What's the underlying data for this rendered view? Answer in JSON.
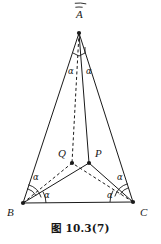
{
  "figure": {
    "caption": "图 10.3(7)",
    "colors": {
      "stroke": "#1a1a1a",
      "background": "#ffffff",
      "label": "#1a1a1a"
    },
    "vertices": [
      {
        "name": "A",
        "label": "A",
        "x": 79,
        "y": 33,
        "label_x": 76,
        "label_y": 18,
        "dot": true
      },
      {
        "name": "B",
        "label": "B",
        "x": 23,
        "y": 203,
        "label_x": 7,
        "label_y": 216,
        "dot": true
      },
      {
        "name": "C",
        "label": "C",
        "x": 133,
        "y": 202,
        "label_x": 140,
        "label_y": 216,
        "dot": true
      },
      {
        "name": "Q",
        "label": "Q",
        "x": 72,
        "y": 163,
        "label_x": 58,
        "label_y": 157,
        "dot": true
      },
      {
        "name": "P",
        "label": "P",
        "x": 89,
        "y": 163,
        "label_x": 95,
        "label_y": 157,
        "dot": true
      }
    ],
    "edges": [
      {
        "name": "side-AB",
        "from": "A",
        "to": "B",
        "style": "solid"
      },
      {
        "name": "side-AC",
        "from": "A",
        "to": "C",
        "style": "solid"
      },
      {
        "name": "side-BC",
        "from": "B",
        "to": "C",
        "style": "solid"
      },
      {
        "name": "cevian-AP",
        "from": "A",
        "to": "P",
        "style": "solid"
      },
      {
        "name": "cevian-AQ",
        "from": "A",
        "to": "Q",
        "style": "dashed"
      },
      {
        "name": "cevian-BP",
        "from": "B",
        "to": "P",
        "style": "solid"
      },
      {
        "name": "cevian-BQ",
        "from": "B",
        "to": "Q",
        "style": "dashed"
      },
      {
        "name": "cevian-CP",
        "from": "C",
        "to": "P",
        "style": "solid"
      },
      {
        "name": "cevian-CQ",
        "from": "C",
        "to": "Q",
        "style": "dashed"
      }
    ],
    "angle_labels": [
      {
        "name": "angle-alpha-apex-left",
        "text": "α",
        "x": 68,
        "y": 74
      },
      {
        "name": "angle-alpha-apex-right",
        "text": "α",
        "x": 86,
        "y": 74
      },
      {
        "name": "angle-alpha-b-upper",
        "text": "α",
        "x": 33,
        "y": 180
      },
      {
        "name": "angle-alpha-b-lower",
        "text": "α",
        "x": 44,
        "y": 198
      },
      {
        "name": "angle-alpha-c-upper",
        "text": "α",
        "x": 117,
        "y": 180
      },
      {
        "name": "angle-alpha-c-lower",
        "text": "α",
        "x": 107,
        "y": 198
      }
    ],
    "angle_arcs": [
      {
        "name": "arc-apex-a",
        "cx": 79,
        "cy": 33,
        "r": 26,
        "start": 262,
        "end": 278
      },
      {
        "name": "arc-apex-b",
        "cx": 79,
        "cy": 33,
        "r": 30,
        "start": 262,
        "end": 284
      },
      {
        "name": "arc-vertex-b-1",
        "cx": 23,
        "cy": 203,
        "r": 15,
        "start": 286,
        "end": 330
      },
      {
        "name": "arc-vertex-b-2",
        "cx": 23,
        "cy": 203,
        "r": 19,
        "start": 286,
        "end": 343
      },
      {
        "name": "arc-vertex-b-3",
        "cx": 23,
        "cy": 203,
        "r": 23,
        "start": 330,
        "end": 360
      },
      {
        "name": "arc-vertex-c-1",
        "cx": 133,
        "cy": 202,
        "r": 15,
        "start": 210,
        "end": 254
      },
      {
        "name": "arc-vertex-c-2",
        "cx": 133,
        "cy": 202,
        "r": 19,
        "start": 197,
        "end": 254
      },
      {
        "name": "arc-vertex-c-3",
        "cx": 133,
        "cy": 202,
        "r": 23,
        "start": 180,
        "end": 210
      }
    ],
    "right_angle_marker": {
      "name": "right-angle-mark-apex",
      "points": "73,53 79,56 85,53 85,47"
    }
  }
}
